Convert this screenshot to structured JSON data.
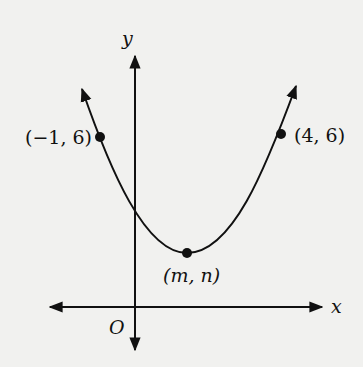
{
  "diagram": {
    "type": "parabola-graph",
    "axes": {
      "x_label": "x",
      "y_label": "y",
      "origin_label": "O"
    },
    "points": [
      {
        "label": "(−1, 6)",
        "x": -1,
        "y": 6
      },
      {
        "label": "(4, 6)",
        "x": 4,
        "y": 6
      },
      {
        "label": "(m, n)",
        "role": "vertex"
      }
    ],
    "colors": {
      "ink": "#111111",
      "paper": "#f1f1ef"
    }
  }
}
